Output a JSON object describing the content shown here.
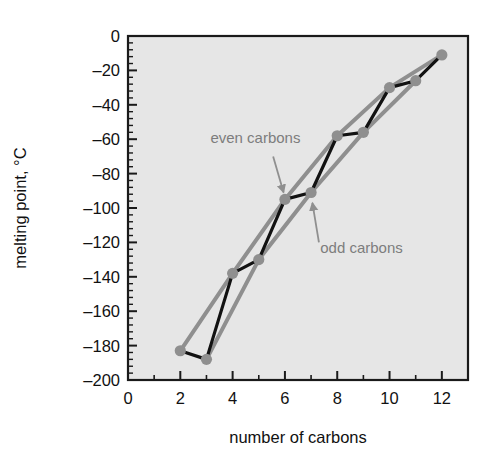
{
  "chart_data": {
    "type": "line",
    "title": "",
    "subtitle": "",
    "xlabel": "number of carbons",
    "ylabel": "melting point, °C",
    "xlim": [
      0,
      13
    ],
    "ylim": [
      -200,
      0
    ],
    "grid": false,
    "legend_position": "inline-annotations",
    "plot_bg_color": "#e6e6e6",
    "frame_color": "#1a1a1a",
    "marker_color": "#8f8f8f",
    "connector_color": "#121212",
    "trend_color": "#8f8f8f",
    "x_major_ticks": [
      0,
      2,
      4,
      6,
      8,
      10,
      12
    ],
    "x_major_tick_labels": [
      "0",
      "2",
      "4",
      "6",
      "8",
      "10",
      "12"
    ],
    "x_minor_ticks": [
      1,
      3,
      5,
      7,
      9,
      11,
      13
    ],
    "y_major_ticks": [
      0,
      -20,
      -40,
      -60,
      -80,
      -100,
      -120,
      -140,
      -160,
      -180,
      -200
    ],
    "y_major_tick_labels": [
      "0",
      "–20",
      "–40",
      "–60",
      "–80",
      "–100",
      "–120",
      "–140",
      "–160",
      "–180",
      "–200"
    ],
    "y_minor_tick_step": 4,
    "x": [
      2,
      3,
      4,
      5,
      6,
      7,
      8,
      9,
      10,
      11,
      12
    ],
    "y": [
      -183,
      -188,
      -138,
      -130,
      -95,
      -91,
      -58,
      -56,
      -30,
      -26,
      -11
    ],
    "series": [
      {
        "name": "all carbons",
        "style": "zigzag-connector",
        "color": "#121212",
        "x": [
          2,
          3,
          4,
          5,
          6,
          7,
          8,
          9,
          10,
          11,
          12
        ],
        "values": [
          -183,
          -188,
          -138,
          -130,
          -95,
          -91,
          -58,
          -56,
          -30,
          -26,
          -11
        ]
      },
      {
        "name": "even carbons",
        "style": "trend-line",
        "color": "#8f8f8f",
        "x": [
          2,
          4,
          6,
          8,
          10,
          12
        ],
        "values": [
          -183,
          -138,
          -95,
          -58,
          -30,
          -11
        ]
      },
      {
        "name": "odd carbons",
        "style": "trend-line",
        "color": "#8f8f8f",
        "x": [
          3,
          5,
          7,
          9,
          11
        ],
        "values": [
          -188,
          -130,
          -91,
          -56,
          -26
        ]
      }
    ],
    "annotations": [
      {
        "id": "even-carbons",
        "text": "even carbons",
        "text_x": 3.15,
        "text_y": -62,
        "arrow_from_x": 5.55,
        "arrow_from_y": -70,
        "arrow_to_x": 5.95,
        "arrow_to_y": -91
      },
      {
        "id": "odd-carbons",
        "text": "odd carbons",
        "text_x": 7.35,
        "text_y": -126,
        "arrow_from_x": 7.3,
        "arrow_from_y": -120,
        "arrow_to_x": 7.05,
        "arrow_to_y": -97
      }
    ]
  }
}
